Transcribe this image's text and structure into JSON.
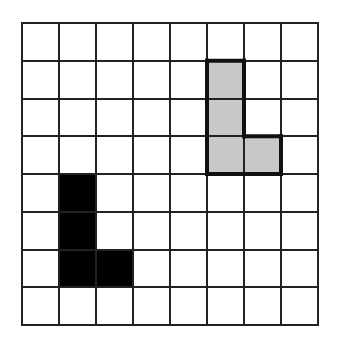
{
  "diagram": {
    "grid": {
      "rows": 8,
      "cols": 8
    },
    "shapes": [
      {
        "name": "gray-l-shape",
        "fill": "#c8c8c8",
        "outline": "#111111",
        "outline_width": 4,
        "cells": [
          [
            1,
            5
          ],
          [
            2,
            5
          ],
          [
            3,
            5
          ],
          [
            3,
            6
          ]
        ]
      },
      {
        "name": "black-l-shape",
        "fill": "#000000",
        "outline": "#000000",
        "outline_width": 0,
        "cells": [
          [
            4,
            1
          ],
          [
            5,
            1
          ],
          [
            6,
            1
          ],
          [
            6,
            2
          ]
        ]
      }
    ]
  }
}
